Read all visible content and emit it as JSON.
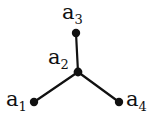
{
  "figure": {
    "kind": "star-graph-diagram",
    "background_color": "#ffffff",
    "stroke_color": "#111111",
    "vertex_color": "#111111",
    "edge_width": 2,
    "vertex_radius": 4
  },
  "graph": {
    "vertices": [
      {
        "id": "a1",
        "label_text": "a",
        "label_sub": "1",
        "x": 34,
        "y": 102,
        "label_x": 6,
        "label_y": 89
      },
      {
        "id": "a2",
        "label_text": "a",
        "label_sub": "2",
        "x": 78,
        "y": 72,
        "label_x": 48,
        "label_y": 47
      },
      {
        "id": "a3",
        "label_text": "a",
        "label_sub": "3",
        "x": 76,
        "y": 33,
        "label_x": 62,
        "label_y": 2
      },
      {
        "id": "a4",
        "label_text": "a",
        "label_sub": "4",
        "x": 119,
        "y": 102,
        "label_x": 126,
        "label_y": 89
      }
    ],
    "edges": [
      {
        "from": "a2",
        "to": "a3"
      },
      {
        "from": "a2",
        "to": "a1"
      },
      {
        "from": "a2",
        "to": "a4"
      }
    ]
  },
  "labels": {
    "a1": {
      "base": "a",
      "sub": "1"
    },
    "a2": {
      "base": "a",
      "sub": "2"
    },
    "a3": {
      "base": "a",
      "sub": "3"
    },
    "a4": {
      "base": "a",
      "sub": "4"
    }
  }
}
